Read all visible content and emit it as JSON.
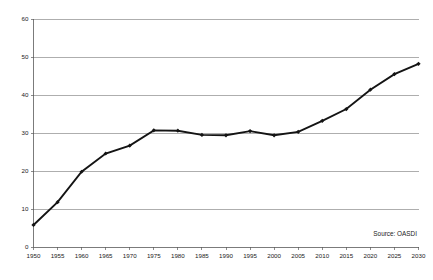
{
  "chart_data": {
    "type": "line",
    "title": "",
    "xlabel": "",
    "ylabel": "",
    "categories": [
      1950,
      1955,
      1960,
      1965,
      1970,
      1975,
      1980,
      1985,
      1990,
      1995,
      2000,
      2005,
      2010,
      2015,
      2020,
      2025,
      2030
    ],
    "values": [
      5.8,
      11.8,
      19.8,
      24.6,
      26.7,
      30.7,
      30.6,
      29.5,
      29.4,
      30.5,
      29.4,
      30.3,
      33.2,
      36.3,
      41.4,
      45.5,
      48.2
    ],
    "series": [
      {
        "name": "OASDI",
        "values": [
          5.8,
          11.8,
          19.8,
          24.6,
          26.7,
          30.7,
          30.6,
          29.5,
          29.4,
          30.5,
          29.4,
          30.3,
          33.2,
          36.3,
          41.4,
          45.5,
          48.2
        ]
      }
    ],
    "x_tick_labels": [
      "1950",
      "1955",
      "1960",
      "1965",
      "1970",
      "1975",
      "1980",
      "1985",
      "1990",
      "1995",
      "2000",
      "2005",
      "2010",
      "2015",
      "2020",
      "2025",
      "2030"
    ],
    "y_tick_labels": [
      "0",
      "10",
      "20",
      "30",
      "40",
      "50",
      "60"
    ],
    "y_ticks": [
      0,
      10,
      20,
      30,
      40,
      50,
      60
    ],
    "ylim": [
      0,
      60
    ],
    "xlim": [
      1950,
      2030
    ],
    "grid": "horizontal",
    "legend": "none",
    "marker": "diamond",
    "line_color": "#141414",
    "grid_color": "#8c8c8c",
    "background": "#ffffff",
    "annotations": [
      {
        "text": "Source: OASDI",
        "position": "bottom-right"
      }
    ]
  },
  "annotation": {
    "source_text": "Source: OASDI"
  }
}
